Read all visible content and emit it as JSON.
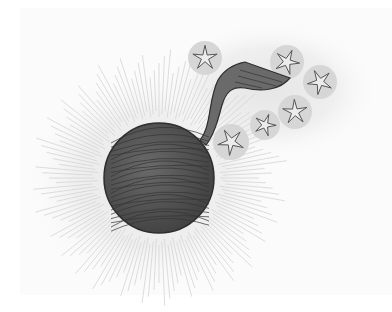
{
  "illustration": {
    "subject": "dark yarn-ball sphere with ribbon tail and starry bubbles",
    "colors": {
      "paper": "#fbfbfb",
      "sphere": "#5a5a5a",
      "sphere_stroke": "#2e2e2e",
      "ribbon": "#6a6a6a",
      "bubble": "#d6d6d6",
      "rays": "#cfcfcf",
      "star_stroke": "#555555"
    },
    "sphere": {
      "cx": 159,
      "cy": 178,
      "r": 55
    },
    "bubbles": [
      {
        "cx": 205,
        "cy": 58,
        "r": 17
      },
      {
        "cx": 287,
        "cy": 62,
        "r": 17
      },
      {
        "cx": 320,
        "cy": 82,
        "r": 17
      },
      {
        "cx": 295,
        "cy": 112,
        "r": 17
      },
      {
        "cx": 265,
        "cy": 125,
        "r": 15
      },
      {
        "cx": 231,
        "cy": 142,
        "r": 18
      }
    ]
  }
}
